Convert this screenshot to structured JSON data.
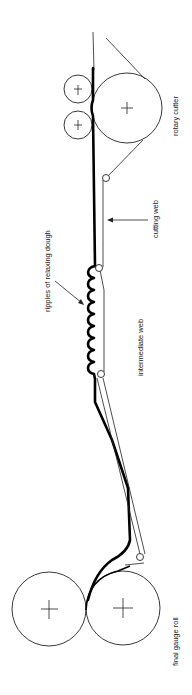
{
  "diagram": {
    "orientation": "rotated 90 degrees counter-clockwise",
    "labels": {
      "rotary_cutter": "rotary cutter",
      "cutting_web": "cutting web",
      "intermediate_web": "intermediate web",
      "ripples": "ripples of relaxing dough",
      "final_gauge_roll": "final gauge roll"
    },
    "components": [
      {
        "name": "final gauge roll",
        "type": "roll pair"
      },
      {
        "name": "intermediate web",
        "type": "inclined conveyor"
      },
      {
        "name": "ripples of relaxing dough",
        "type": "dough sheet feature"
      },
      {
        "name": "cutting web",
        "type": "conveyor"
      },
      {
        "name": "rotary cutter",
        "type": "roll with two pressure rolls"
      }
    ],
    "colors": {
      "line": "#222222",
      "dough": "#000000",
      "background": "#ffffff"
    }
  }
}
